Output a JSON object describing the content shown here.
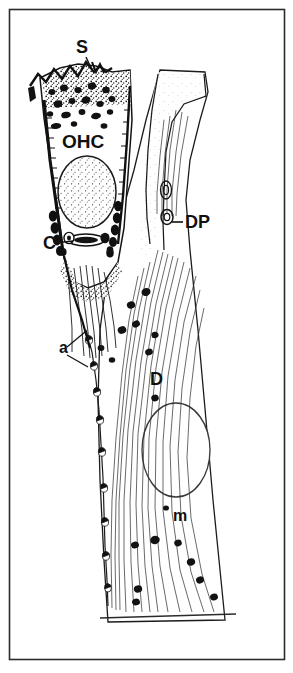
{
  "figure": {
    "kind": "anatomical-line-drawing",
    "background_color": "#ffffff",
    "ink_color": "#101010",
    "border": {
      "present": true,
      "color": "#2b2b2b",
      "x": 9,
      "y": 9,
      "width": 276,
      "height": 651
    }
  },
  "labels": [
    {
      "id": "S",
      "text": "S",
      "meaning": "stereocilia",
      "x": 82,
      "y": 53,
      "size": "lbl-md",
      "leader": {
        "x1": 86,
        "y1": 57,
        "x2": 92,
        "y2": 70
      }
    },
    {
      "id": "OHC",
      "text": "OHC",
      "meaning": "outer hair cell",
      "x": 62,
      "y": 148,
      "size": "lbl-lg",
      "leader": null
    },
    {
      "id": "C",
      "text": "C",
      "meaning": "cuticular / synaptic region at cell base",
      "x": 43,
      "y": 249,
      "size": "lbl-md",
      "leader": {
        "x1": 54,
        "y1": 243,
        "x2": 73,
        "y2": 241
      }
    },
    {
      "id": "DP",
      "text": "DP",
      "meaning": "Deiters' phalangeal process",
      "x": 185,
      "y": 228,
      "size": "lbl-md",
      "leader": {
        "x1": 183,
        "y1": 222,
        "x2": 172,
        "y2": 222
      }
    },
    {
      "id": "a",
      "text": "a",
      "meaning": "afferent nerve endings",
      "x": 59,
      "y": 353,
      "size": "lbl-sm",
      "leader": null
    },
    {
      "id": "D",
      "text": "D",
      "meaning": "Deiters' cell",
      "x": 150,
      "y": 385,
      "size": "lbl-md",
      "leader": null
    },
    {
      "id": "m",
      "text": "m",
      "meaning": "mitochondria",
      "x": 173,
      "y": 521,
      "size": "lbl-sm",
      "leader": null
    }
  ],
  "leaders_extra": [
    {
      "name": "a-leader-upper",
      "x1": 67,
      "y1": 347,
      "x2": 85,
      "y2": 332
    },
    {
      "name": "a-leader-lower",
      "x1": 67,
      "y1": 355,
      "x2": 88,
      "y2": 367
    }
  ],
  "structures": {
    "ohc_body": "tall columnar cell, dark stippled lateral walls, apex bearing stereocilia",
    "ohc_nucleus": "large stippled oval, lower third of the hair cell",
    "deiters_cell": "broad supporting cell widening toward the basilar membrane",
    "deiters_nucleus": "large clear oval outline in the mid lower body",
    "phalangeal_process": "slender process ascending to a flared plate at the reticular lamina",
    "microtubule_bundles": "dense parallel fiber striations through the Deiters' cell",
    "afferent_chain": "beaded chain of nerve endings down the left contour",
    "basilar_membrane": "horizontal line across the base of the figure"
  }
}
